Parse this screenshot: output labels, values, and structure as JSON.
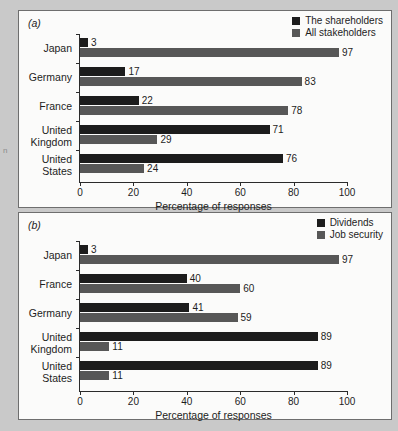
{
  "page": {
    "background_color": "#c9c9c9",
    "margin_artifact": "n"
  },
  "colors": {
    "series_dark": "#1c1c1c",
    "series_gray": "#575757",
    "panel_background": "#fbfbfa",
    "panel_border": "#6e6e6e",
    "text": "#1d1d1d",
    "axis": "#2b2b2b"
  },
  "panels": [
    {
      "label": "(a)",
      "legend": [
        {
          "name": "The shareholders",
          "color": "#1c1c1c"
        },
        {
          "name": "All stakeholders",
          "color": "#575757"
        }
      ],
      "chart_data": {
        "type": "bar",
        "orientation": "horizontal",
        "title": "",
        "xlabel": "Percentage of responses",
        "ylabel": "",
        "xlim": [
          0,
          100
        ],
        "xticks": [
          0,
          20,
          40,
          60,
          80,
          100
        ],
        "xtick_labels": [
          "0",
          "20",
          "40",
          "60",
          "80",
          "100"
        ],
        "grid": false,
        "legend_position": "top-right",
        "categories": [
          "Japan",
          "Germany",
          "France",
          "United Kingdom",
          "United States"
        ],
        "series": [
          {
            "name": "The shareholders",
            "color": "#1c1c1c",
            "values": [
              3,
              17,
              22,
              71,
              76
            ]
          },
          {
            "name": "All stakeholders",
            "color": "#575757",
            "values": [
              97,
              83,
              78,
              29,
              24
            ]
          }
        ]
      }
    },
    {
      "label": "(b)",
      "legend": [
        {
          "name": "Dividends",
          "color": "#1c1c1c"
        },
        {
          "name": "Job security",
          "color": "#575757"
        }
      ],
      "chart_data": {
        "type": "bar",
        "orientation": "horizontal",
        "title": "",
        "xlabel": "Percentage of responses",
        "ylabel": "",
        "xlim": [
          0,
          100
        ],
        "xticks": [
          0,
          20,
          40,
          60,
          80,
          100
        ],
        "xtick_labels": [
          "0",
          "20",
          "40",
          "60",
          "80",
          "100"
        ],
        "grid": false,
        "legend_position": "top-right",
        "categories": [
          "Japan",
          "France",
          "Germany",
          "United Kingdom",
          "United States"
        ],
        "series": [
          {
            "name": "Dividends",
            "color": "#1c1c1c",
            "values": [
              3,
              40,
              41,
              89,
              89
            ]
          },
          {
            "name": "Job security",
            "color": "#575757",
            "values": [
              97,
              60,
              59,
              11,
              11
            ]
          }
        ]
      }
    }
  ]
}
